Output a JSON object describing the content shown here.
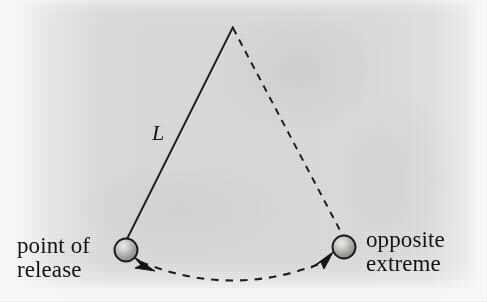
{
  "figure": {
    "background_color": "#dededc",
    "ink_color": "#1a1a1a",
    "labels": {
      "point_of_release": "point of\nrelease",
      "opposite_extreme": "opposite\nextreme",
      "length": "L"
    },
    "elements": {
      "pivot": {
        "name": "pivot-point",
        "x": 233,
        "y": 27
      },
      "bob_left": {
        "name": "pendulum-bob-release",
        "cx": 126,
        "cy": 250,
        "r": 11.5
      },
      "bob_right": {
        "name": "pendulum-bob-extreme",
        "cx": 344,
        "cy": 247,
        "r": 11.5
      },
      "string_solid": {
        "name": "pendulum-string-solid",
        "x1": 233,
        "y1": 27,
        "x2": 126,
        "y2": 241
      },
      "string_dashed": {
        "name": "pendulum-string-dashed",
        "x1": 233,
        "y1": 27,
        "x2": 343,
        "y2": 237
      },
      "swing_arc": {
        "name": "swing-path-arc",
        "start_x": 140,
        "start_y": 261,
        "end_x": 330,
        "end_y": 259,
        "sag_y": 288
      },
      "arrow_left": {
        "name": "swing-direction-arrow-left",
        "x": 148,
        "y": 264
      },
      "arrow_right": {
        "name": "swing-direction-arrow-right",
        "x": 324,
        "y": 261
      }
    }
  }
}
